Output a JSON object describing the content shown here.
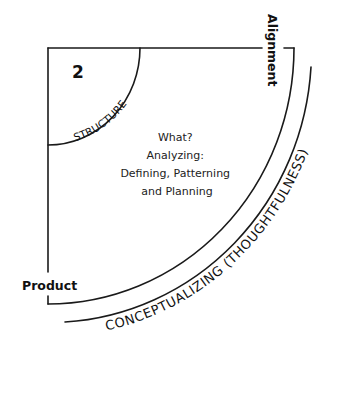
{
  "diagram": {
    "quadrant_number": "2",
    "inner_arc_label": "STRUCTURE",
    "center_text": {
      "line1": "What?",
      "line2": "Analyzing:",
      "line3": "Defining, Patterning",
      "line4": "and Planning"
    },
    "top_axis_label": "Alignment",
    "left_axis_label": "Product",
    "outer_arc_label": "CONCEPTUALIZING (THOUGHTFULNESS)",
    "colors": {
      "stroke": "#1a1a1a",
      "background": "#ffffff"
    }
  }
}
